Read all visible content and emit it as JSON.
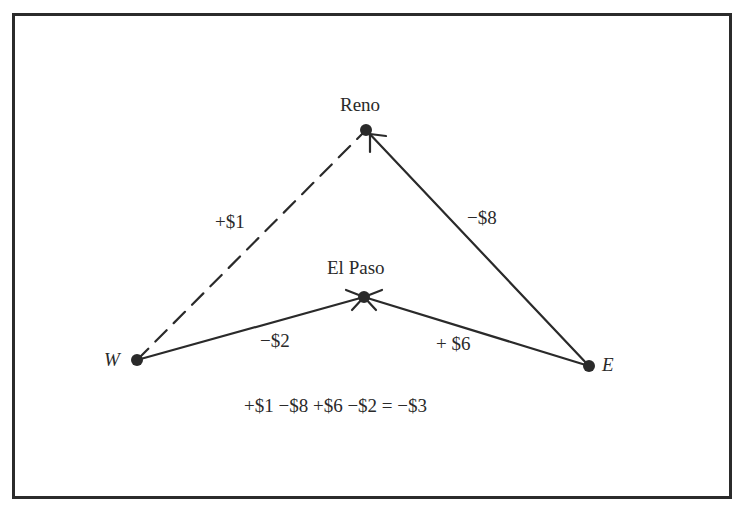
{
  "diagram": {
    "nodes": [
      {
        "id": "reno",
        "label": "Reno",
        "x": 366,
        "y": 130
      },
      {
        "id": "elpaso",
        "label": "El Paso",
        "x": 364,
        "y": 297
      },
      {
        "id": "w",
        "label": "W",
        "x": 137,
        "y": 360
      },
      {
        "id": "e",
        "label": "E",
        "x": 589,
        "y": 366
      }
    ],
    "edges": [
      {
        "from": "w",
        "to": "reno",
        "label": "+$1",
        "style": "dashed"
      },
      {
        "from": "e",
        "to": "reno",
        "label": "−$8",
        "style": "solid",
        "arrow": true
      },
      {
        "from": "e",
        "to": "elpaso",
        "label": "+ $6",
        "style": "solid",
        "arrow": true
      },
      {
        "from": "w",
        "to": "elpaso",
        "label": "−$2",
        "style": "solid",
        "arrow": true
      }
    ],
    "equation": "+$1 −$8 +$6 −$2 = −$3",
    "colors": {
      "ink": "#2a2a2a",
      "background": "#ffffff"
    }
  }
}
